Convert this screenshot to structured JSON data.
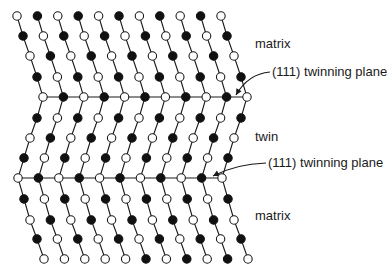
{
  "figure": {
    "colors": {
      "line": "#1a1a1a",
      "filled_atom": "#111111",
      "open_atom_fill": "#ffffff",
      "open_atom_stroke": "#1a1a1a"
    },
    "lattice": {
      "row_y": [
        16,
        36,
        56,
        77,
        97,
        118,
        138,
        158,
        178,
        199,
        220,
        239,
        259
      ],
      "row_x0": [
        17,
        23,
        30,
        37,
        43,
        37,
        30,
        24,
        18,
        24,
        30,
        37,
        44
      ],
      "column_spacing": 20.4,
      "columns": 11,
      "atom_radius": 4.2,
      "row_patterns": [
        "OFOFOFOFOFO",
        "FOFOFOFOFOF",
        "OFOFOFOFOFO",
        "FOFOFOFOFOF",
        "OFOFOFOFOFO",
        "FOFOFOFOFOF",
        "OFOFOFOFOFO",
        "FOFOFOFOFOF",
        "OFOFOFOFOFO",
        "FOFOFOFOFOF",
        "OFOFOFOFOFO",
        "FOFOFOFOFOF",
        "OOOOOFOFOFO"
      ],
      "twinning_plane_rows": [
        4,
        8
      ]
    },
    "labels": {
      "matrix_top": "matrix",
      "plane_top": "(111) twinning plane",
      "twin": "twin",
      "plane_bottom": "(111) twinning plane",
      "matrix_bottom": "matrix"
    },
    "arrows": [
      {
        "from": [
          270,
          72
        ],
        "ctrl": [
          248,
          74
        ],
        "to": [
          236,
          95
        ]
      },
      {
        "from": [
          266,
          163
        ],
        "ctrl": [
          236,
          164
        ],
        "to": [
          213,
          176
        ]
      }
    ]
  }
}
